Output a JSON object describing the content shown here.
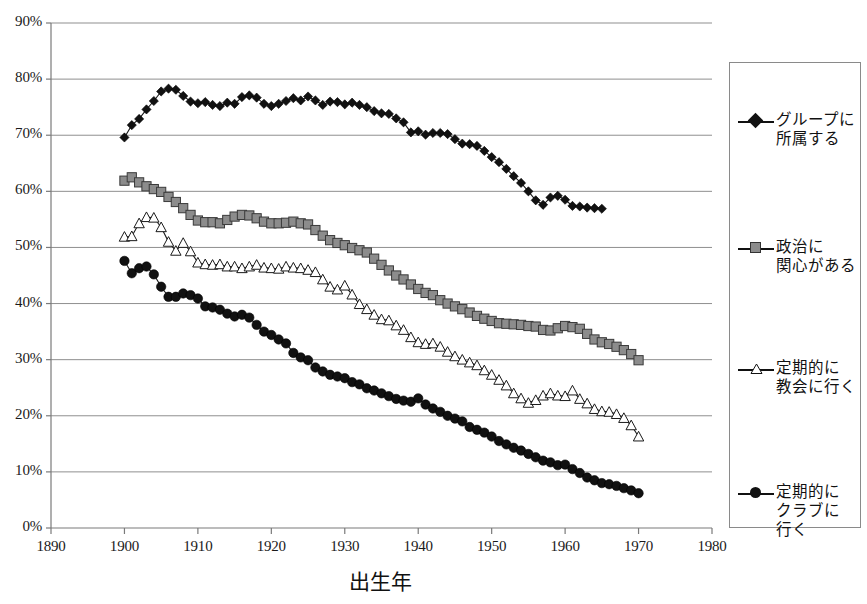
{
  "chart_data": {
    "type": "line",
    "title": "",
    "xlabel": "出生年",
    "ylabel": "",
    "xlim": [
      1890,
      1980
    ],
    "ylim": [
      0,
      0.9
    ],
    "grid": true,
    "legend_position": "right",
    "x_ticks": [
      "1890",
      "1900",
      "1910",
      "1920",
      "1930",
      "1940",
      "1950",
      "1960",
      "1970",
      "1980"
    ],
    "y_ticks": [
      "0%",
      "10%",
      "20%",
      "30%",
      "40%",
      "50%",
      "60%",
      "70%",
      "80%",
      "90%"
    ],
    "series": [
      {
        "name": "グループに\n所属する",
        "marker": "diamond",
        "color": "#111111",
        "x": [
          1900,
          1901,
          1902,
          1903,
          1904,
          1905,
          1906,
          1907,
          1908,
          1909,
          1910,
          1911,
          1912,
          1913,
          1914,
          1915,
          1916,
          1917,
          1918,
          1919,
          1920,
          1921,
          1922,
          1923,
          1924,
          1925,
          1926,
          1927,
          1928,
          1929,
          1930,
          1931,
          1932,
          1933,
          1934,
          1935,
          1936,
          1937,
          1938,
          1939,
          1940,
          1941,
          1942,
          1943,
          1944,
          1945,
          1946,
          1947,
          1948,
          1949,
          1950,
          1951,
          1952,
          1953,
          1954,
          1955,
          1956,
          1957,
          1958,
          1959,
          1960,
          1961,
          1962,
          1963,
          1964,
          1965
        ],
        "values": [
          69.6,
          71.8,
          72.9,
          74.6,
          76.1,
          77.8,
          78.3,
          78.1,
          77.0,
          76.0,
          75.7,
          75.9,
          75.4,
          75.2,
          75.8,
          75.6,
          76.8,
          77.1,
          76.7,
          75.6,
          75.2,
          75.6,
          76.1,
          76.6,
          76.2,
          76.9,
          76.2,
          75.4,
          76.0,
          75.9,
          75.5,
          75.8,
          75.4,
          75.0,
          74.3,
          73.9,
          73.8,
          73.0,
          72.3,
          70.5,
          70.7,
          70.1,
          70.4,
          70.4,
          70.2,
          69.3,
          68.5,
          68.4,
          68.1,
          67.2,
          66.1,
          65.2,
          64.0,
          62.7,
          61.5,
          60.0,
          58.4,
          57.6,
          58.9,
          59.2,
          58.5,
          57.4,
          57.3,
          57.1,
          57.0,
          56.9
        ]
      },
      {
        "name": "政治に\n関心がある",
        "marker": "square",
        "color": "#8c8c8c",
        "x": [
          1900,
          1901,
          1902,
          1903,
          1904,
          1905,
          1906,
          1907,
          1908,
          1909,
          1910,
          1911,
          1912,
          1913,
          1914,
          1915,
          1916,
          1917,
          1918,
          1919,
          1920,
          1921,
          1922,
          1923,
          1924,
          1925,
          1926,
          1927,
          1928,
          1929,
          1930,
          1931,
          1932,
          1933,
          1934,
          1935,
          1936,
          1937,
          1938,
          1939,
          1940,
          1941,
          1942,
          1943,
          1944,
          1945,
          1946,
          1947,
          1948,
          1949,
          1950,
          1951,
          1952,
          1953,
          1954,
          1955,
          1956,
          1957,
          1958,
          1959,
          1960,
          1961,
          1962,
          1963,
          1964,
          1965,
          1966,
          1967,
          1968,
          1969,
          1970
        ],
        "values": [
          61.9,
          62.5,
          61.6,
          60.9,
          60.4,
          59.9,
          59.0,
          58.1,
          57.0,
          55.8,
          54.8,
          54.5,
          54.5,
          54.3,
          54.9,
          55.5,
          55.8,
          55.7,
          55.2,
          54.6,
          54.3,
          54.3,
          54.4,
          54.6,
          54.3,
          54.1,
          53.1,
          52.1,
          51.3,
          50.8,
          50.4,
          49.9,
          49.5,
          49.1,
          48.0,
          46.9,
          45.9,
          45.0,
          44.3,
          43.4,
          42.6,
          41.9,
          41.5,
          40.6,
          40.0,
          39.5,
          39.0,
          38.4,
          37.8,
          37.3,
          36.9,
          36.5,
          36.4,
          36.3,
          36.2,
          36.0,
          35.9,
          35.3,
          35.2,
          35.6,
          36.0,
          35.8,
          35.5,
          34.6,
          33.6,
          33.1,
          32.8,
          32.3,
          31.7,
          31.0,
          29.9
        ]
      },
      {
        "name": "定期的に\n教会に行く",
        "marker": "triangle",
        "color": "#ffffff",
        "x": [
          1900,
          1901,
          1902,
          1903,
          1904,
          1905,
          1906,
          1907,
          1908,
          1909,
          1910,
          1911,
          1912,
          1913,
          1914,
          1915,
          1916,
          1917,
          1918,
          1919,
          1920,
          1921,
          1922,
          1923,
          1924,
          1925,
          1926,
          1927,
          1928,
          1929,
          1930,
          1931,
          1932,
          1933,
          1934,
          1935,
          1936,
          1937,
          1938,
          1939,
          1940,
          1941,
          1942,
          1943,
          1944,
          1945,
          1946,
          1947,
          1948,
          1949,
          1950,
          1951,
          1952,
          1953,
          1954,
          1955,
          1956,
          1957,
          1958,
          1959,
          1960,
          1961,
          1962,
          1963,
          1964,
          1965,
          1966,
          1967,
          1968,
          1969,
          1970
        ],
        "values": [
          51.9,
          52.0,
          54.3,
          55.4,
          55.3,
          53.6,
          51.0,
          49.4,
          50.8,
          49.3,
          47.3,
          47.0,
          46.9,
          47.0,
          46.6,
          46.6,
          46.3,
          46.6,
          46.9,
          46.4,
          46.3,
          46.2,
          46.6,
          46.4,
          46.3,
          46.0,
          45.6,
          44.3,
          43.0,
          42.5,
          43.2,
          41.6,
          39.9,
          39.0,
          38.0,
          37.2,
          37.0,
          36.1,
          35.3,
          34.0,
          33.1,
          32.8,
          32.9,
          32.3,
          31.4,
          30.6,
          30.0,
          29.5,
          29.0,
          28.1,
          27.3,
          26.4,
          25.4,
          24.0,
          23.1,
          22.3,
          22.8,
          23.6,
          24.0,
          23.6,
          23.5,
          24.5,
          23.0,
          22.2,
          21.2,
          20.8,
          20.7,
          20.3,
          19.6,
          18.3,
          16.3
        ]
      },
      {
        "name": "定期的に\nクラブに\n行く",
        "marker": "circle",
        "color": "#111111",
        "x": [
          1900,
          1901,
          1902,
          1903,
          1904,
          1905,
          1906,
          1907,
          1908,
          1909,
          1910,
          1911,
          1912,
          1913,
          1914,
          1915,
          1916,
          1917,
          1918,
          1919,
          1920,
          1921,
          1922,
          1923,
          1924,
          1925,
          1926,
          1927,
          1928,
          1929,
          1930,
          1931,
          1932,
          1933,
          1934,
          1935,
          1936,
          1937,
          1938,
          1939,
          1940,
          1941,
          1942,
          1943,
          1944,
          1945,
          1946,
          1947,
          1948,
          1949,
          1950,
          1951,
          1952,
          1953,
          1954,
          1955,
          1956,
          1957,
          1958,
          1959,
          1960,
          1961,
          1962,
          1963,
          1964,
          1965,
          1966,
          1967,
          1968,
          1969,
          1970
        ],
        "values": [
          47.6,
          45.4,
          46.3,
          46.6,
          45.2,
          43.0,
          41.2,
          41.2,
          41.8,
          41.5,
          40.9,
          39.5,
          39.3,
          38.9,
          38.2,
          37.7,
          38.0,
          37.5,
          36.2,
          35.0,
          34.4,
          33.6,
          32.9,
          31.2,
          30.4,
          29.9,
          28.6,
          27.9,
          27.3,
          27.0,
          26.7,
          26.0,
          25.6,
          24.9,
          24.5,
          24.0,
          23.5,
          23.0,
          22.7,
          22.5,
          23.1,
          22.0,
          21.3,
          20.7,
          20.0,
          19.5,
          19.0,
          18.0,
          17.5,
          17.0,
          16.3,
          15.5,
          14.9,
          14.3,
          13.8,
          13.2,
          12.6,
          12.0,
          11.7,
          11.2,
          11.3,
          10.5,
          9.8,
          9.0,
          8.5,
          8.0,
          7.8,
          7.5,
          7.1,
          6.7,
          6.2
        ]
      }
    ]
  }
}
